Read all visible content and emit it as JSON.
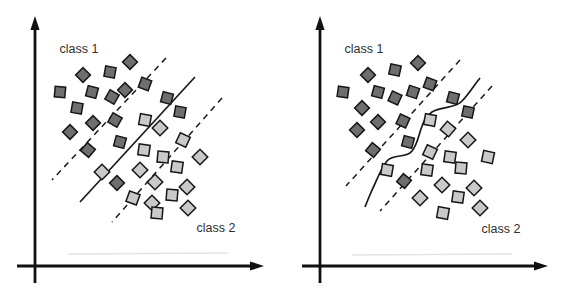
{
  "figure": {
    "width": 567,
    "height": 289
  },
  "colors": {
    "background": "#ffffff",
    "class1_fill": "#6e6e6e",
    "class2_fill": "#c9c9c9",
    "marker_stroke": "#161616",
    "line_stroke": "#1a1a1a",
    "axis_stroke": "#111111",
    "label_text": "#2f2f2f",
    "artifact": "#e3e3e3"
  },
  "marker": {
    "class1_size": 10.5,
    "class2_size": 11,
    "stroke_width": 1.5
  },
  "panels": [
    {
      "name": "linear-boundary",
      "axis": {
        "x": 35,
        "y": 266,
        "y_top": 16,
        "y_bottom": 283,
        "x_left": 17,
        "x_right": 264
      },
      "class1_label": {
        "text": "class 1",
        "x": 79,
        "y": 53
      },
      "class2_label": {
        "text": "class 2",
        "x": 216,
        "y": 232
      },
      "dashed_lines": [
        {
          "x1": 166,
          "y1": 58,
          "x2": 52,
          "y2": 180
        },
        {
          "x1": 222,
          "y1": 98,
          "x2": 112,
          "y2": 222
        }
      ],
      "separator": {
        "type": "line",
        "x1": 195,
        "y1": 77,
        "x2": 80,
        "y2": 202
      },
      "artifact_line": {
        "x1": 68,
        "y1": 254,
        "x2": 228,
        "y2": 253
      },
      "class1_markers": [
        [
          130,
          62,
          45
        ],
        [
          110,
          72,
          10
        ],
        [
          83,
          75,
          45
        ],
        [
          60,
          92,
          5
        ],
        [
          92,
          92,
          15
        ],
        [
          125,
          90,
          45
        ],
        [
          145,
          84,
          20
        ],
        [
          112,
          97,
          30
        ],
        [
          77,
          108,
          10
        ],
        [
          93,
          123,
          45
        ],
        [
          115,
          120,
          30
        ],
        [
          70,
          132,
          45
        ],
        [
          120,
          142,
          15
        ],
        [
          88,
          150,
          40
        ],
        [
          167,
          98,
          15
        ],
        [
          180,
          112,
          10
        ],
        [
          117,
          183,
          45
        ]
      ],
      "class2_markers": [
        [
          145,
          120,
          10
        ],
        [
          160,
          128,
          45
        ],
        [
          144,
          150,
          8
        ],
        [
          183,
          140,
          25
        ],
        [
          102,
          172,
          45
        ],
        [
          163,
          157,
          5
        ],
        [
          200,
          157,
          45
        ],
        [
          177,
          167,
          8
        ],
        [
          140,
          170,
          45
        ],
        [
          155,
          182,
          45
        ],
        [
          133,
          198,
          20
        ],
        [
          152,
          203,
          45
        ],
        [
          172,
          195,
          5
        ],
        [
          187,
          187,
          45
        ],
        [
          157,
          213,
          5
        ],
        [
          188,
          208,
          45
        ]
      ]
    },
    {
      "name": "nonlinear-boundary",
      "axis": {
        "x": 320,
        "y": 266,
        "y_top": 16,
        "y_bottom": 283,
        "x_left": 302,
        "x_right": 548
      },
      "class1_label": {
        "text": "class 1",
        "x": 364,
        "y": 53
      },
      "class2_label": {
        "text": "class 2",
        "x": 501,
        "y": 233
      },
      "dashed_lines": [
        {
          "x1": 460,
          "y1": 60,
          "x2": 346,
          "y2": 186
        },
        {
          "x1": 492,
          "y1": 86,
          "x2": 380,
          "y2": 211
        }
      ],
      "separator": {
        "type": "curve",
        "path": "M480,78 C472,88 468,95 462,101 C455,109 441,106 432,112 C425,117 424,121 421,129 C418,138 417,145 412,151 C406,159 394,153 387,161 C381,168 377,180 372,190 C369,197 367,202 365,207"
      },
      "artifact_line": {
        "x1": 352,
        "y1": 255,
        "x2": 512,
        "y2": 254
      },
      "class1_markers": [
        [
          418,
          63,
          45
        ],
        [
          395,
          70,
          12
        ],
        [
          368,
          75,
          45
        ],
        [
          343,
          92,
          8
        ],
        [
          378,
          92,
          15
        ],
        [
          413,
          92,
          18
        ],
        [
          430,
          84,
          20
        ],
        [
          395,
          98,
          25
        ],
        [
          362,
          108,
          45
        ],
        [
          453,
          98,
          15
        ],
        [
          468,
          112,
          12
        ],
        [
          378,
          122,
          45
        ],
        [
          357,
          130,
          45
        ],
        [
          403,
          121,
          25
        ],
        [
          408,
          142,
          15
        ],
        [
          373,
          150,
          40
        ],
        [
          404,
          181,
          40
        ]
      ],
      "class2_markers": [
        [
          430,
          120,
          10
        ],
        [
          448,
          129,
          40
        ],
        [
          468,
          140,
          45
        ],
        [
          430,
          152,
          25
        ],
        [
          450,
          157,
          8
        ],
        [
          488,
          157,
          12
        ],
        [
          387,
          170,
          10
        ],
        [
          427,
          170,
          8
        ],
        [
          461,
          168,
          5
        ],
        [
          442,
          185,
          45
        ],
        [
          474,
          188,
          45
        ],
        [
          420,
          198,
          45
        ],
        [
          458,
          197,
          8
        ],
        [
          443,
          213,
          10
        ],
        [
          480,
          208,
          45
        ]
      ]
    }
  ]
}
